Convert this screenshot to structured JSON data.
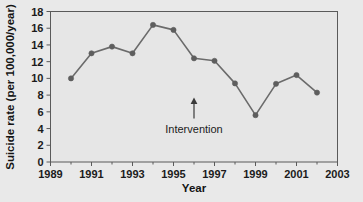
{
  "chart_data": {
    "type": "line",
    "title": "",
    "xlabel": "Year",
    "ylabel": "Suicide rate (per 100,000/year)",
    "xlim": [
      1989,
      2003
    ],
    "ylim": [
      0,
      18
    ],
    "xticks": [
      1989,
      1991,
      1993,
      1995,
      1997,
      1999,
      2001,
      2003
    ],
    "xtick_labels": [
      "1989",
      "1991",
      "1993",
      "1995",
      "1997",
      "1999",
      "2001",
      "2003"
    ],
    "xminor_ticks": [
      1990,
      1992,
      1994,
      1996,
      1998,
      2000,
      2002
    ],
    "yticks": [
      0,
      2,
      4,
      6,
      8,
      10,
      12,
      14,
      16,
      18
    ],
    "ytick_labels": [
      "0",
      "2",
      "4",
      "6",
      "8",
      "10",
      "12",
      "14",
      "16",
      "18"
    ],
    "grid": false,
    "legend": "none",
    "marker": "circle",
    "line_color": "#6b6b6b",
    "marker_color": "#5e5e5e",
    "x": [
      1990,
      1991,
      1992,
      1993,
      1994,
      1995,
      1996,
      1997,
      1998,
      1999,
      2000,
      2001,
      2002
    ],
    "values": [
      10.0,
      13.0,
      13.8,
      13.0,
      16.4,
      15.8,
      12.4,
      12.1,
      9.4,
      5.6,
      9.35,
      10.4,
      8.3
    ],
    "series": [
      {
        "name": "Suicide rate",
        "values": [
          10.0,
          13.0,
          13.8,
          13.0,
          16.4,
          15.8,
          12.4,
          12.1,
          9.4,
          5.6,
          9.35,
          10.4,
          8.3
        ]
      }
    ],
    "annotations": [
      {
        "label": "Intervention",
        "x": 1996,
        "y": 7.7,
        "arrow": "up"
      }
    ]
  },
  "axis": {
    "y_title": "Suicide rate (per 100,000/year)",
    "x_title": "Year"
  },
  "annotation": {
    "intervention_label": "Intervention"
  },
  "colors": {
    "background": "#e9e9e9",
    "axis": "#555555",
    "line": "#6b6b6b",
    "marker": "#5e5e5e",
    "text": "#1b1b1b"
  }
}
